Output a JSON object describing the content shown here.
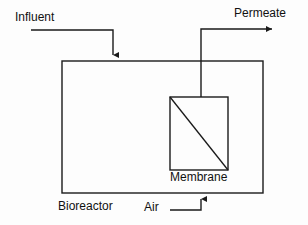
{
  "diagram": {
    "type": "process-flow-diagram",
    "background_color": "#fdfdfd",
    "line_color": "#1a1a1a",
    "text_color": "#111111",
    "labels": {
      "influent": "Influent",
      "permeate": "Permeate",
      "membrane": "Membrane",
      "bioreactor": "Bioreactor",
      "air": "Air"
    },
    "shapes": {
      "bioreactor_tank": {
        "name": "Bioreactor",
        "x": 62,
        "y": 61,
        "width": 201,
        "height": 132
      },
      "membrane_module": {
        "name": "Membrane",
        "x": 170,
        "y": 97,
        "width": 58,
        "height": 73,
        "diagonal": "top-left to bottom-right"
      }
    },
    "flows": [
      {
        "name": "influent-flow",
        "label": "Influent",
        "direction": "into bioreactor, downward arrow",
        "path": "M31,30 L113,30 L113,61"
      },
      {
        "name": "permeate-flow",
        "label": "Permeate",
        "direction": "out of membrane, rightward arrow",
        "path": "M201,97 L201,29 L278,29"
      },
      {
        "name": "air-flow",
        "label": "Air",
        "direction": "into bioreactor bottom, upward arrow",
        "path": "M170,210 L201,210 L201,193"
      }
    ]
  }
}
